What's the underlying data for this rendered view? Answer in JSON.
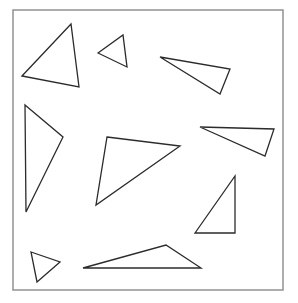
{
  "figure": {
    "width": 298,
    "height": 303,
    "background": "#ffffff",
    "frame": {
      "x": 13,
      "y": 10,
      "width": 270,
      "height": 280,
      "stroke": "#8a8a8a"
    },
    "shape_stroke": "#2b2b2b",
    "shapes": [
      {
        "id": "triangle-1",
        "points": "22,76 71,24 79,87"
      },
      {
        "id": "triangle-2",
        "points": "98,53 123,35 127,67"
      },
      {
        "id": "triangle-3",
        "points": "160,57 230,69 220,94"
      },
      {
        "id": "triangle-4",
        "points": "25,105 63,137 26,212"
      },
      {
        "id": "triangle-5",
        "points": "107,137 180,146 96,205"
      },
      {
        "id": "triangle-6",
        "points": "200,127 274,129 265,156"
      },
      {
        "id": "triangle-7",
        "points": "195,233 235,176 235,233"
      },
      {
        "id": "triangle-8",
        "points": "31,252 60,262 37,282"
      },
      {
        "id": "triangle-9",
        "points": "83,268 166,245 201,268"
      }
    ]
  }
}
